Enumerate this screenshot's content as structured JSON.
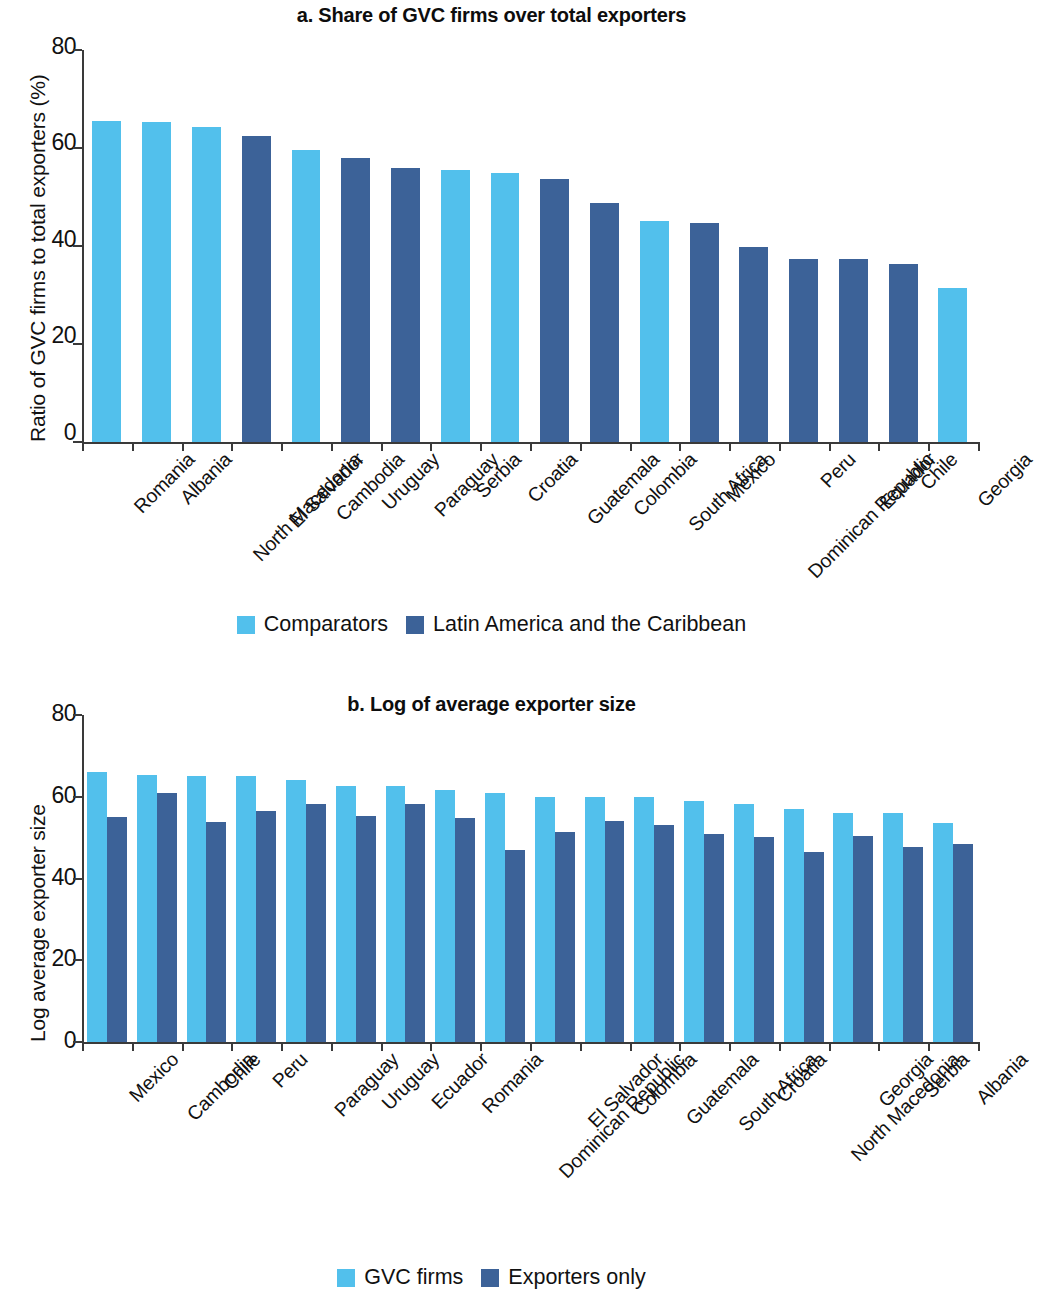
{
  "figure": {
    "background": "#ffffff",
    "colors": {
      "light_blue": "#52c0ec",
      "dark_blue": "#3c6298",
      "axis": "#3a3a3a"
    }
  },
  "panel_a": {
    "title": "a. Share of GVC firms over total exporters",
    "ylabel": "Ratio of GVC firms to total exporters (%)",
    "yticks": [
      "80",
      "60",
      "40",
      "20",
      "0"
    ],
    "legend": [
      {
        "label": "Comparators",
        "color": "#52c0ec"
      },
      {
        "label": "Latin America and the Caribbean",
        "color": "#3c6298"
      }
    ]
  },
  "panel_b": {
    "title": "b. Log of average exporter size",
    "ylabel": "Log average exporter size",
    "yticks": [
      "80",
      "60",
      "40",
      "20",
      "0"
    ],
    "legend": [
      {
        "label": "GVC firms",
        "color": "#52c0ec"
      },
      {
        "label": "Exporters only",
        "color": "#3c6298"
      }
    ]
  },
  "chart_data": [
    {
      "type": "bar",
      "panel": "a",
      "title": "a. Share of GVC firms over total exporters",
      "xlabel": "",
      "ylabel": "Ratio of GVC firms to total exporters (%)",
      "ylim": [
        0,
        80
      ],
      "yticks": [
        0,
        20,
        40,
        60,
        80
      ],
      "grid": false,
      "legend_position": "bottom",
      "legend": [
        "Comparators",
        "Latin America and the Caribbean"
      ],
      "categories": [
        "Romania",
        "Albania",
        "North Macedonia",
        "El Salvador",
        "Cambodia",
        "Uruguay",
        "Paraguay",
        "Serbia",
        "Croatia",
        "Guatemala",
        "Colombia",
        "South Africa",
        "Mexico",
        "Dominican Republic",
        "Peru",
        "Ecuador",
        "Chile",
        "Georgia"
      ],
      "values": [
        65.5,
        65.4,
        64.2,
        62.4,
        59.6,
        57.9,
        56.0,
        55.5,
        55.0,
        53.6,
        48.7,
        45.2,
        44.7,
        39.8,
        37.4,
        37.4,
        36.4,
        31.4
      ],
      "groups": [
        "Comparators",
        "Comparators",
        "Comparators",
        "Latin America and the Caribbean",
        "Comparators",
        "Latin America and the Caribbean",
        "Latin America and the Caribbean",
        "Comparators",
        "Comparators",
        "Latin America and the Caribbean",
        "Latin America and the Caribbean",
        "Comparators",
        "Latin America and the Caribbean",
        "Latin America and the Caribbean",
        "Latin America and the Caribbean",
        "Latin America and the Caribbean",
        "Latin America and the Caribbean",
        "Comparators"
      ]
    },
    {
      "type": "bar",
      "panel": "b",
      "title": "b. Log of average exporter size",
      "xlabel": "",
      "ylabel": "Log average exporter size",
      "ylim": [
        0,
        80
      ],
      "yticks": [
        0,
        20,
        40,
        60,
        80
      ],
      "grid": false,
      "legend_position": "bottom",
      "categories": [
        "Mexico",
        "Cambodia",
        "Chile",
        "Peru",
        "Paraguay",
        "Uruguay",
        "Ecuador",
        "Romania",
        "Dominican Republic",
        "El Salvador",
        "Colombia",
        "Guatemala",
        "South Africa",
        "Croatia",
        "North Macedonia",
        "Georgia",
        "Serbia",
        "Albania"
      ],
      "series": [
        {
          "name": "GVC firms",
          "color": "#52c0ec",
          "values": [
            66.0,
            65.4,
            65.0,
            65.0,
            64.0,
            62.7,
            62.6,
            61.6,
            61.0,
            60.0,
            60.0,
            60.0,
            59.0,
            58.2,
            57.0,
            56.0,
            56.0,
            53.5
          ]
        },
        {
          "name": "Exporters only",
          "color": "#3c6298",
          "values": [
            55.0,
            61.0,
            53.8,
            56.4,
            58.2,
            55.2,
            58.2,
            54.8,
            47.0,
            51.3,
            54.0,
            53.2,
            51.0,
            50.2,
            46.6,
            50.5,
            47.8,
            48.4
          ]
        }
      ]
    }
  ]
}
